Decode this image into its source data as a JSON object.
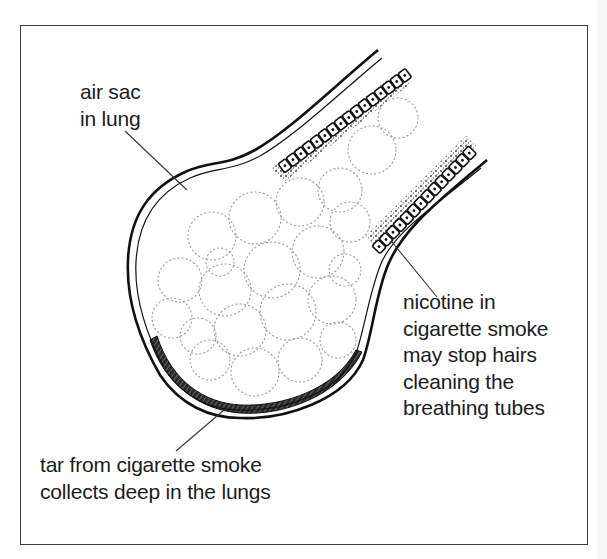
{
  "diagram": {
    "labels": {
      "air_sac": {
        "lines": [
          "air sac",
          "in lung"
        ]
      },
      "nicotine": {
        "lines": [
          "nicotine in",
          "cigarette smoke",
          "may stop hairs",
          "cleaning the",
          "breathing tubes"
        ]
      },
      "tar": {
        "lines": [
          "tar from cigarette smoke",
          "collects deep in the lungs"
        ]
      }
    },
    "parts": [
      "breathing-tube",
      "ciliated-epithelium-cells",
      "air-sac-wall",
      "alveoli",
      "tar-deposit"
    ],
    "colors": {
      "ink": "#1c1c1c",
      "frame": "#3a3a3a",
      "alveoli_dots": "#9a9a9a",
      "background": "#ffffff"
    }
  }
}
